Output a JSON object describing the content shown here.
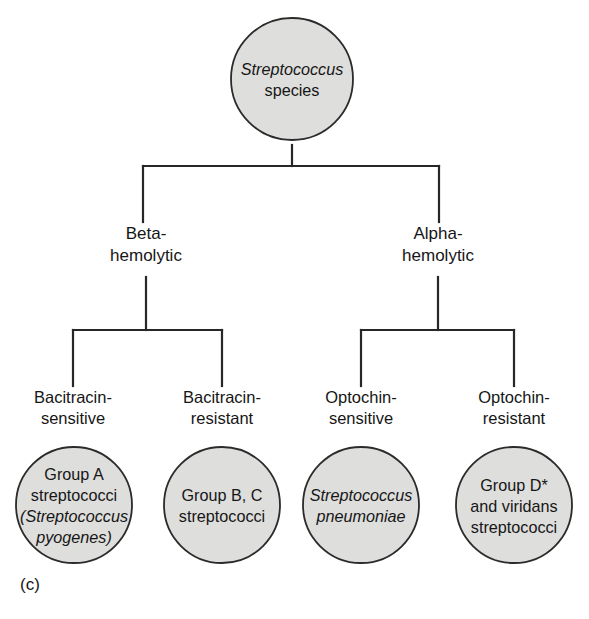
{
  "figure": {
    "label": "(c)",
    "root": {
      "line1": "Streptococcus",
      "line1_style": "italic",
      "line2": "species"
    },
    "level1": [
      {
        "name": "beta-hemolytic",
        "line1": "Beta-",
        "line2": "hemolytic"
      },
      {
        "name": "alpha-hemolytic",
        "line1": "Alpha-",
        "line2": "hemolytic"
      }
    ],
    "level2": [
      {
        "name": "bacitracin-sensitive",
        "line1": "Bacitracin-",
        "line2": "sensitive"
      },
      {
        "name": "bacitracin-resistant",
        "line1": "Bacitracin-",
        "line2": "resistant"
      },
      {
        "name": "optochin-sensitive",
        "line1": "Optochin-",
        "line2": "sensitive"
      },
      {
        "name": "optochin-resistant",
        "line1": "Optochin-",
        "line2": "resistant"
      }
    ],
    "leaves": [
      {
        "name": "group-a-streptococci",
        "line1": "Group A",
        "line2": "streptococci",
        "line3": "(Streptococcus",
        "line4": "pyogenes)",
        "italic_lines": [
          3,
          4
        ]
      },
      {
        "name": "group-b-c-streptococci",
        "line1": "Group B, C",
        "line2": "streptococci",
        "italic_lines": []
      },
      {
        "name": "streptococcus-pneumoniae",
        "line1": "Streptococcus",
        "line2": "pneumoniae",
        "italic_lines": [
          1,
          2
        ]
      },
      {
        "name": "group-d-viridans-streptococci",
        "line1": "Group D*",
        "line2": "and viridans",
        "line3": "streptococci",
        "italic_lines": []
      }
    ],
    "colors": {
      "circle_fill": "#dededc",
      "circle_stroke": "#2b2b2b",
      "connector": "#272727",
      "text": "#161616",
      "background": "#ffffff"
    }
  }
}
